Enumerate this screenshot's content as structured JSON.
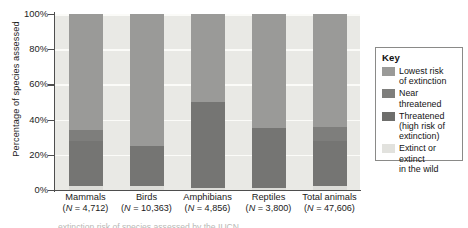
{
  "figure": {
    "ylabel": "Percentage of species assessed"
  },
  "yaxis": {
    "ticks": [
      "100%",
      "80%",
      "60%",
      "40%",
      "20%",
      "0%"
    ]
  },
  "legend": {
    "title": "Key",
    "items": [
      {
        "label": "Lowest risk\nof extinction",
        "line1": "Lowest risk",
        "line2": "of extinction",
        "color": "#9a9a98"
      },
      {
        "label": "Near\nthreatened",
        "line1": "Near",
        "line2": "threatened",
        "color": "#7e7e7c"
      },
      {
        "label": "Threatened\n(high risk of\nextinction)",
        "line1": "Threatened",
        "line2": "(high risk of",
        "line3": "extinction)",
        "color": "#6e6e6c"
      },
      {
        "label": "Extinct or\nextinct\nin the wild",
        "line1": "Extinct or",
        "line2": "extinct",
        "line3": "in the wild",
        "color": "#e2e2de"
      }
    ]
  },
  "categories": [
    {
      "name": "Mammals",
      "n": "(N = 4,712)"
    },
    {
      "name": "Birds",
      "n": "(N = 10,363)"
    },
    {
      "name": "Amphibians",
      "n": "(N = 4,856)"
    },
    {
      "name": "Reptiles",
      "n": "(N = 3,800)"
    },
    {
      "name": "Total animals",
      "n": "(N = 47,606)"
    }
  ],
  "caption_cutoff": "extinction risk of species assessed by the IUCN",
  "chart_data": {
    "type": "bar",
    "title": "",
    "xlabel": "",
    "ylabel": "Percentage of species assessed",
    "ylim": [
      0,
      100
    ],
    "ytick_values": [
      0,
      20,
      40,
      60,
      80,
      100
    ],
    "ytick_labels": [
      "0%",
      "20%",
      "40%",
      "60%",
      "80%",
      "100%"
    ],
    "grid": true,
    "stacked": true,
    "legend_position": "right",
    "categories": [
      "Mammals",
      "Birds",
      "Amphibians",
      "Reptiles",
      "Total animals"
    ],
    "category_counts": [
      "N = 4,712",
      "N = 10,363",
      "N = 4,856",
      "N = 3,800",
      "N = 47,606"
    ],
    "series": [
      {
        "name": "Extinct or extinct in the wild",
        "color": "#dcdcd8",
        "values": [
          2,
          2,
          1,
          1,
          2
        ]
      },
      {
        "name": "Threatened (high risk of extinction)",
        "color": "#757573",
        "values": [
          26,
          23,
          49,
          34,
          26
        ]
      },
      {
        "name": "Near threatened",
        "color": "#7e7e7c",
        "values": [
          6,
          0,
          0,
          0,
          8
        ]
      },
      {
        "name": "Lowest risk of extinction",
        "color": "#9a9a98",
        "values": [
          66,
          75,
          50,
          65,
          64
        ]
      }
    ]
  }
}
